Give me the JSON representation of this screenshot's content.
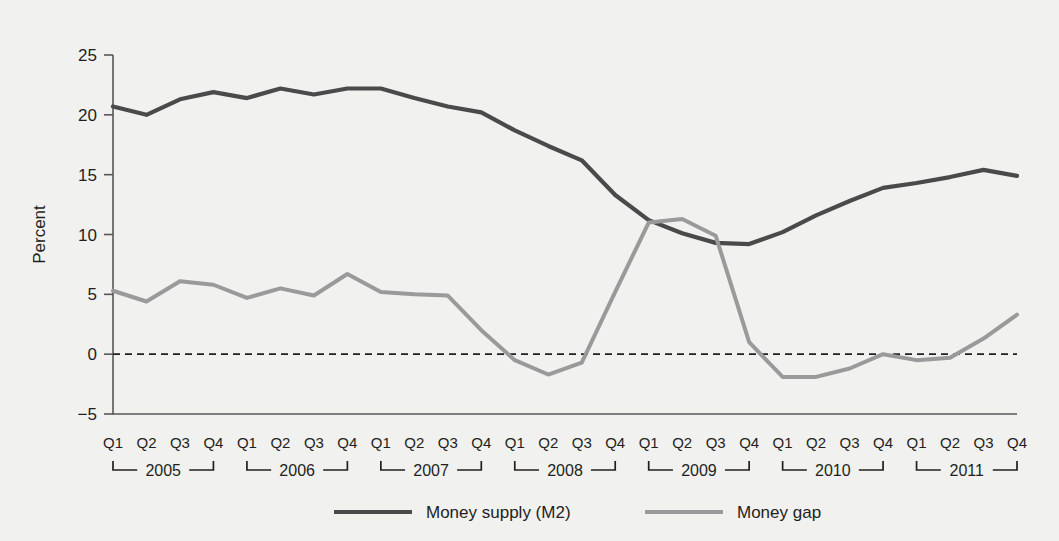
{
  "chart_data": {
    "type": "line",
    "title": "",
    "xlabel": "",
    "ylabel": "Percent",
    "ylim": [
      -5,
      25
    ],
    "yticks": [
      -5,
      0,
      5,
      10,
      15,
      20,
      25
    ],
    "ytick_labels": [
      "−5",
      "0",
      "5",
      "10",
      "15",
      "20",
      "25"
    ],
    "grid": false,
    "zero_reference_line": true,
    "legend_position": "bottom-center",
    "years": [
      "2005",
      "2006",
      "2007",
      "2008",
      "2009",
      "2010",
      "2011"
    ],
    "quarters": [
      "Q1",
      "Q2",
      "Q3",
      "Q4"
    ],
    "x": [
      "2005 Q1",
      "2005 Q2",
      "2005 Q3",
      "2005 Q4",
      "2006 Q1",
      "2006 Q2",
      "2006 Q3",
      "2006 Q4",
      "2007 Q1",
      "2007 Q2",
      "2007 Q3",
      "2007 Q4",
      "2008 Q1",
      "2008 Q2",
      "2008 Q3",
      "2008 Q4",
      "2009 Q1",
      "2009 Q2",
      "2009 Q3",
      "2009 Q4",
      "2010 Q1",
      "2010 Q2",
      "2010 Q3",
      "2010 Q4",
      "2011 Q1",
      "2011 Q2",
      "2011 Q3",
      "2011 Q4"
    ],
    "series": [
      {
        "name": "Money supply (M2)",
        "color": "#4a4a4a",
        "values": [
          20.7,
          20.0,
          21.3,
          21.9,
          21.4,
          22.2,
          21.7,
          22.2,
          22.2,
          21.4,
          20.7,
          20.2,
          18.7,
          17.4,
          16.2,
          13.3,
          11.2,
          10.1,
          9.3,
          9.2,
          10.2,
          11.6,
          12.8,
          13.9,
          14.3,
          14.8,
          15.4,
          14.9
        ]
      },
      {
        "name": "Money gap",
        "color": "#9a9a9a",
        "values": [
          5.3,
          4.4,
          6.1,
          5.8,
          4.7,
          5.5,
          4.9,
          6.7,
          5.2,
          5.0,
          4.9,
          2.0,
          -0.5,
          -1.7,
          -0.7,
          5.2,
          11.0,
          11.3,
          9.9,
          1.0,
          -1.9,
          -1.9,
          -1.2,
          0.0,
          -0.5,
          -0.3,
          1.3,
          3.3
        ]
      }
    ],
    "legend": [
      {
        "label": "Money supply (M2)",
        "color": "#4a4a4a"
      },
      {
        "label": "Money gap",
        "color": "#9a9a9a"
      }
    ]
  }
}
